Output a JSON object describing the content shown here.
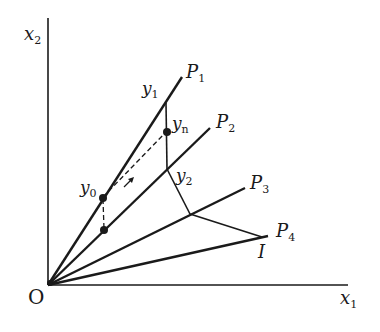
{
  "diagram": {
    "axes": {
      "x_label": "x",
      "x_sub": "1",
      "y_label": "x",
      "y_sub": "2",
      "origin_label": "O"
    },
    "rays": [
      {
        "label": "P",
        "sub": "1"
      },
      {
        "label": "P",
        "sub": "2"
      },
      {
        "label": "P",
        "sub": "3"
      },
      {
        "label": "P",
        "sub": "4"
      }
    ],
    "points": {
      "y0": {
        "label": "y",
        "sub": "0"
      },
      "y1": {
        "label": "y",
        "sub": "1"
      },
      "y2": {
        "label": "y",
        "sub": "2"
      },
      "yn": {
        "label": "y",
        "sub": "n"
      },
      "I": {
        "label": "I"
      }
    },
    "colors": {
      "ink": "#1a1a1a",
      "background": "#ffffff"
    }
  }
}
